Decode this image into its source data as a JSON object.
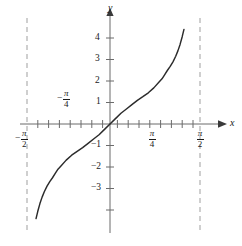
{
  "figure": {
    "kind": "function-graph",
    "background_color": "#ffffff",
    "curve_color": "#2b2b2b",
    "axis_color": "#6b6b6b",
    "asymptote_color": "#a8a8a8",
    "text_color": "#1a1a1a"
  },
  "axes": {
    "x_axis_label": "x",
    "y_axis_label": "y",
    "x_tick_labels": [
      {
        "id": "neg-pi-over-2",
        "sign": "−",
        "numerator": "π",
        "denominator": "2"
      },
      {
        "id": "neg-pi-over-4",
        "sign": "−",
        "numerator": "π",
        "denominator": "4"
      },
      {
        "id": "pi-over-4",
        "sign": "",
        "numerator": "π",
        "denominator": "4"
      },
      {
        "id": "pi-over-2",
        "sign": "",
        "numerator": "π",
        "denominator": "2"
      }
    ],
    "y_tick_labels": [
      "4",
      "3",
      "2",
      "1",
      "−1",
      "−2",
      "−3"
    ]
  },
  "chart_data": {
    "type": "line",
    "title": "",
    "subtitle": "",
    "xlabel": "x",
    "ylabel": "y",
    "function": "y = tan(x)",
    "xlim": [
      -1.6493361431346414,
      1.6493361431346414
    ],
    "ylim": [
      -4.651162790697675,
      4.883720930232558
    ],
    "grid": false,
    "legend": null,
    "x_ticks": [
      -1.5707963267948966,
      -1.3744467859455345,
      -1.1780972450961724,
      -0.9817477042468103,
      -0.7853981633974483,
      -0.5890486225480862,
      -0.39269908169872414,
      -0.19634954084936207,
      0,
      0.19634954084936207,
      0.39269908169872414,
      0.5890486225480862,
      0.7853981633974483,
      0.9817477042468103,
      1.1780972450961724,
      1.3744467859455345,
      1.5707963267948966
    ],
    "x_tick_labels": [
      {
        "value": -1.5707963267948966,
        "text": "-π/2"
      },
      {
        "value": -0.7853981633974483,
        "text": "-π/4"
      },
      {
        "value": 0.7853981633974483,
        "text": "π/4"
      },
      {
        "value": 1.5707963267948966,
        "text": "π/2"
      }
    ],
    "y_ticks": [
      -4,
      -3,
      -2,
      -1,
      0,
      1,
      2,
      3,
      4
    ],
    "y_tick_labels": [
      {
        "value": 4,
        "text": "4"
      },
      {
        "value": 3,
        "text": "3"
      },
      {
        "value": 2,
        "text": "2"
      },
      {
        "value": 1,
        "text": "1"
      },
      {
        "value": -1,
        "text": "−1"
      },
      {
        "value": -2,
        "text": "−2"
      },
      {
        "value": -3,
        "text": "−3"
      }
    ],
    "asymptotes": [
      {
        "orientation": "vertical",
        "x": -1.5707963267948966,
        "style": "dashed"
      },
      {
        "orientation": "vertical",
        "x": 1.5707963267948966,
        "style": "dashed"
      }
    ],
    "series": [
      {
        "name": "tan(x)",
        "style": "solid",
        "color": "#2b2b2b",
        "x": [
          -1.3509,
          -1.32,
          -1.28,
          -1.24,
          -1.2,
          -1.15,
          -1.1,
          -1.05,
          -1.0,
          -0.95,
          -0.9,
          -0.8,
          -0.7,
          -0.6,
          -0.5,
          -0.4,
          -0.3,
          -0.2,
          -0.1,
          0.0,
          0.1,
          0.2,
          0.3,
          0.4,
          0.5,
          0.6,
          0.7,
          0.8,
          0.9,
          0.95,
          1.0,
          1.05,
          1.1,
          1.15,
          1.2,
          1.24,
          1.28,
          1.32,
          1.3509
        ],
        "y": [
          -4.4,
          -4.0723,
          -3.7016,
          -3.4017,
          -3.1515,
          -2.89,
          -2.68,
          -2.5,
          -2.3,
          -2.1,
          -1.96,
          -1.68,
          -1.45,
          -1.27,
          -1.1,
          -0.9,
          -0.7,
          -0.5,
          -0.25,
          0.0,
          0.25,
          0.5,
          0.7,
          0.9,
          1.1,
          1.27,
          1.45,
          1.68,
          1.96,
          2.1,
          2.3,
          2.5,
          2.68,
          2.89,
          3.1515,
          3.4017,
          3.7016,
          4.0723,
          4.4
        ]
      }
    ]
  }
}
